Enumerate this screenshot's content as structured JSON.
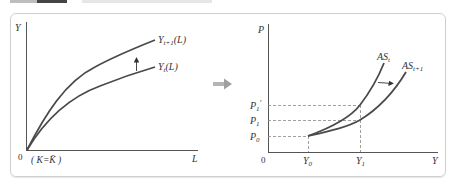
{
  "colors": {
    "axis": "#555555",
    "curve": "#4a4a4a",
    "dashed": "#888888",
    "frame": "#cfcfcf",
    "transition_arrow": "#a8a8a8"
  },
  "left_graph": {
    "y_axis_label": "Y",
    "x_axis_label": "L",
    "origin_label": "0",
    "condition_label": "( K=K̄ )",
    "curves": [
      {
        "name": "Y_{t+1}(L)",
        "base": "Y",
        "sub": "t+1",
        "suffix": "(L)"
      },
      {
        "name": "Y_t(L)",
        "base": "Y",
        "sub": "t",
        "suffix": "(L)"
      }
    ],
    "shift_direction": "up"
  },
  "transition": {
    "icon": "right-arrow"
  },
  "right_graph": {
    "y_axis_label": "P",
    "x_axis_label": "Y",
    "origin_label": "0",
    "y_ticks": [
      {
        "base": "P",
        "sub": "1",
        "prime": "′"
      },
      {
        "base": "P",
        "sub": "1",
        "prime": ""
      },
      {
        "base": "P",
        "sub": "0",
        "prime": ""
      }
    ],
    "x_ticks": [
      {
        "base": "Y",
        "sub": "0"
      },
      {
        "base": "Y",
        "sub": "1"
      }
    ],
    "curves": [
      {
        "name": "AS_t",
        "base": "AS",
        "sub": "t"
      },
      {
        "name": "AS_{t+1}",
        "base": "AS",
        "sub": "t+1"
      }
    ],
    "shift_direction": "right"
  }
}
